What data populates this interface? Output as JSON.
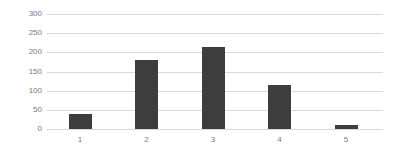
{
  "chart_data": {
    "type": "bar",
    "title": "",
    "categories": [
      "1",
      "2",
      "3",
      "4",
      "5"
    ],
    "values": [
      40,
      180,
      215,
      115,
      10
    ],
    "xlabel": "",
    "ylabel": "",
    "ylim": [
      0,
      300
    ],
    "yticks": [
      0,
      50,
      100,
      150,
      200,
      250,
      300
    ],
    "grid": "horizontal",
    "legend": "none",
    "colors": {
      "bar": "#3d3d3d",
      "gridline": "#d9d9d9",
      "axis_line": "#d9d9d9",
      "tick_label": "#7a7a7a",
      "background": "#ffffff"
    }
  }
}
